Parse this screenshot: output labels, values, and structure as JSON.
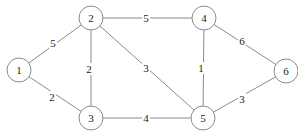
{
  "graph": {
    "nodes": [
      {
        "id": "1",
        "label": "1",
        "x": 19,
        "y": 70
      },
      {
        "id": "2",
        "label": "2",
        "x": 91,
        "y": 18
      },
      {
        "id": "3",
        "label": "3",
        "x": 91,
        "y": 118
      },
      {
        "id": "4",
        "label": "4",
        "x": 204,
        "y": 18
      },
      {
        "id": "5",
        "label": "5",
        "x": 203,
        "y": 118
      },
      {
        "id": "6",
        "label": "6",
        "x": 286,
        "y": 71
      }
    ],
    "edges": [
      {
        "from": "1",
        "to": "2",
        "weight": "5",
        "lx": 53,
        "ly": 43
      },
      {
        "from": "1",
        "to": "3",
        "weight": "2",
        "lx": 52,
        "ly": 97
      },
      {
        "from": "2",
        "to": "3",
        "weight": "2",
        "lx": 89,
        "ly": 69
      },
      {
        "from": "2",
        "to": "4",
        "weight": "5",
        "lx": 146,
        "ly": 18
      },
      {
        "from": "2",
        "to": "5",
        "weight": "3",
        "lx": 146,
        "ly": 68
      },
      {
        "from": "3",
        "to": "5",
        "weight": "4",
        "lx": 146,
        "ly": 118
      },
      {
        "from": "4",
        "to": "5",
        "weight": "1",
        "lx": 201,
        "ly": 68
      },
      {
        "from": "4",
        "to": "6",
        "weight": "6",
        "lx": 242,
        "ly": 41
      },
      {
        "from": "5",
        "to": "6",
        "weight": "3",
        "lx": 242,
        "ly": 99
      }
    ],
    "node_radius": 12
  }
}
